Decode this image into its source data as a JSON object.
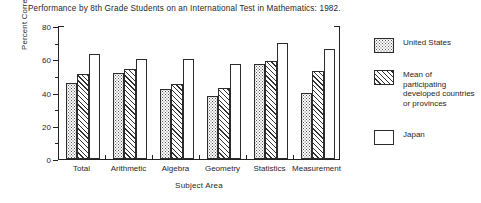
{
  "chart_data": {
    "type": "bar",
    "title": "Performance by 8th Grade Students on an International Test in Mathematics:  1982.",
    "xlabel": "Subject Area",
    "ylabel": "Percent Correct",
    "ylim": [
      0,
      80
    ],
    "yticks": [
      0,
      20,
      40,
      60,
      80
    ],
    "ytick_labels": [
      "0",
      "20",
      "40",
      "60",
      "80"
    ],
    "minor_tick_step": 10,
    "grid": false,
    "legend_position": "right",
    "categories": [
      "Total",
      "Arithmetic",
      "Algebra",
      "Geometry",
      "Statistics",
      "Measurement"
    ],
    "series": [
      {
        "name": "United States",
        "pattern": "stipple",
        "values": [
          46,
          52,
          42,
          38,
          57,
          40
        ]
      },
      {
        "name": "Mean of participating developed countries or provinces",
        "pattern": "diagonal-hatch",
        "values": [
          51,
          54,
          45,
          43,
          59,
          53
        ]
      },
      {
        "name": "Japan",
        "pattern": "solid-white",
        "values": [
          63,
          60,
          60,
          57,
          70,
          66
        ]
      }
    ]
  },
  "legend": {
    "entries": [
      {
        "label": "United States"
      },
      {
        "label": "Mean of participating developed countries or provinces"
      },
      {
        "label": "Japan"
      }
    ]
  },
  "colors": {
    "axis": "#222222",
    "text": "#1f1f1f",
    "background": "#ffffff",
    "pattern_ink": "#2f2f2f"
  }
}
